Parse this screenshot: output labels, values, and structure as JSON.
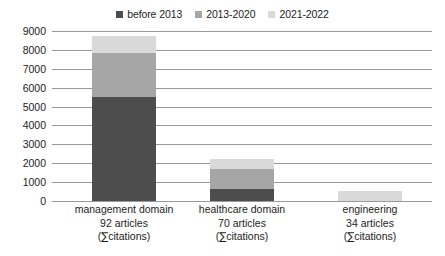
{
  "chart_data": {
    "type": "bar",
    "subtype": "stacked-bar",
    "title": "",
    "xlabel": "",
    "ylabel": "",
    "ylim": [
      0,
      9000
    ],
    "ytick_step": 1000,
    "yticks": [
      "9000",
      "8000",
      "7000",
      "6000",
      "5000",
      "4000",
      "3000",
      "2000",
      "1000",
      "0"
    ],
    "grid": true,
    "legend_position": "top-center",
    "categories": [
      "management domain\n92 articles\n(∑citations)",
      "healthcare domain\n70 articles\n(∑citations)",
      "engineering\n34 articles\n(∑citations)"
    ],
    "series": [
      {
        "name": "before 2013",
        "color": "#4d4d4d",
        "values": [
          5500,
          650,
          0
        ]
      },
      {
        "name": "2013-2020",
        "color": "#a6a6a6",
        "values": [
          2350,
          1050,
          0
        ]
      },
      {
        "name": "2021-2022",
        "color": "#d9d9d9",
        "values": [
          900,
          500,
          550
        ]
      }
    ],
    "totals": [
      8750,
      2200,
      550
    ]
  },
  "legend": {
    "items": [
      {
        "label": "before 2013",
        "color": "#4d4d4d"
      },
      {
        "label": "2013-2020",
        "color": "#a6a6a6"
      },
      {
        "label": "2021-2022",
        "color": "#d9d9d9"
      }
    ]
  },
  "axis": {
    "y_labels": [
      "9000",
      "8000",
      "7000",
      "6000",
      "5000",
      "4000",
      "3000",
      "2000",
      "1000",
      "0"
    ]
  },
  "categories": [
    {
      "name": "management-domain",
      "line1": "management domain",
      "line2": "92 articles",
      "line3_prefix": "(",
      "line3_sigma": "∑",
      "line3_suffix": "citations)"
    },
    {
      "name": "healthcare-domain",
      "line1": "healthcare domain",
      "line2": "70 articles",
      "line3_prefix": "(",
      "line3_sigma": "∑",
      "line3_suffix": "citations)"
    },
    {
      "name": "engineering",
      "line1": "engineering",
      "line2": "34 articles",
      "line3_prefix": "(",
      "line3_sigma": "∑",
      "line3_suffix": "citations)"
    }
  ],
  "colors": {
    "gridline": "#9a9a9a",
    "text": "#1d1d1d",
    "background": "#ffffff"
  }
}
